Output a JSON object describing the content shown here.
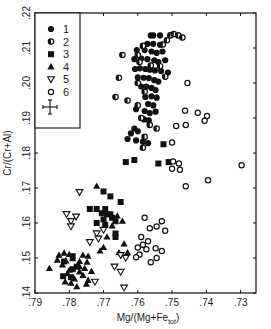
{
  "chart_data": {
    "type": "scatter",
    "title": "",
    "xlabel": "Mg/(Mg+Fe_tot)",
    "xlabel_main": "Mg/(Mg+Fe",
    "xlabel_sub": "tot",
    "xlabel_close": ")",
    "ylabel": "Cr/(Cr+Al)",
    "xlim": [
      0.79,
      0.7255
    ],
    "ylim": [
      0.14,
      0.22
    ],
    "x_reversed": true,
    "grid": false,
    "legend_position": "upper-left (inside frame)",
    "x_ticks": [
      0.79,
      0.78,
      0.77,
      0.76,
      0.75,
      0.74,
      0.73
    ],
    "x_tick_labels": [
      ".79",
      ".78",
      ".77",
      ".76",
      ".75",
      ".74",
      ".73"
    ],
    "y_ticks": [
      0.14,
      0.15,
      0.16,
      0.17,
      0.18,
      0.19,
      0.2,
      0.21,
      0.22
    ],
    "y_tick_labels": [
      ".14",
      ".15",
      ".16",
      ".17",
      ".18",
      ".19",
      ".20",
      ".21",
      ".22"
    ],
    "error_bar_legend": {
      "x_err": 0.0015,
      "y_err": 0.0015
    },
    "series": [
      {
        "name": "1",
        "marker": "filled-circle",
        "points": [
          [
            0.7562,
            0.2136
          ],
          [
            0.7555,
            0.2136
          ],
          [
            0.7535,
            0.2136
          ],
          [
            0.7572,
            0.2112
          ],
          [
            0.7555,
            0.2112
          ],
          [
            0.7535,
            0.2109
          ],
          [
            0.7603,
            0.2094
          ],
          [
            0.758,
            0.2094
          ],
          [
            0.756,
            0.209
          ],
          [
            0.7545,
            0.2086
          ],
          [
            0.7528,
            0.209
          ],
          [
            0.761,
            0.2068
          ],
          [
            0.759,
            0.207
          ],
          [
            0.7572,
            0.2068
          ],
          [
            0.7552,
            0.2065
          ],
          [
            0.754,
            0.206
          ],
          [
            0.752,
            0.2065
          ],
          [
            0.7608,
            0.204
          ],
          [
            0.7594,
            0.2042
          ],
          [
            0.7578,
            0.204
          ],
          [
            0.7565,
            0.2038
          ],
          [
            0.755,
            0.2036
          ],
          [
            0.7532,
            0.2034
          ],
          [
            0.7512,
            0.203
          ],
          [
            0.76,
            0.2016
          ],
          [
            0.7583,
            0.2015
          ],
          [
            0.7568,
            0.2014
          ],
          [
            0.7552,
            0.2008
          ],
          [
            0.754,
            0.2004
          ],
          [
            0.759,
            0.199
          ],
          [
            0.7575,
            0.199
          ],
          [
            0.756,
            0.1986
          ],
          [
            0.7548,
            0.198
          ],
          [
            0.7578,
            0.196
          ],
          [
            0.756,
            0.1962
          ],
          [
            0.7545,
            0.1958
          ],
          [
            0.757,
            0.194
          ],
          [
            0.7555,
            0.1936
          ],
          [
            0.7605,
            0.1925
          ],
          [
            0.758,
            0.192
          ],
          [
            0.7565,
            0.1914
          ],
          [
            0.7548,
            0.1918
          ],
          [
            0.7582,
            0.1896
          ],
          [
            0.7568,
            0.1893
          ],
          [
            0.761,
            0.187
          ],
          [
            0.76,
            0.1862
          ],
          [
            0.762,
            0.1856
          ],
          [
            0.763,
            0.184
          ],
          [
            0.7605,
            0.1836
          ],
          [
            0.7585,
            0.1832
          ],
          [
            0.757,
            0.1828
          ]
        ]
      },
      {
        "name": "2",
        "marker": "half-filled-circle",
        "points": [
          [
            0.7505,
            0.2136
          ],
          [
            0.7495,
            0.214
          ],
          [
            0.7482,
            0.2136
          ],
          [
            0.747,
            0.213
          ],
          [
            0.7515,
            0.2122
          ],
          [
            0.7527,
            0.211
          ],
          [
            0.7585,
            0.2106
          ],
          [
            0.76,
            0.208
          ],
          [
            0.7595,
            0.206
          ],
          [
            0.7562,
            0.205
          ],
          [
            0.7535,
            0.2048
          ],
          [
            0.752,
            0.2018
          ],
          [
            0.7645,
            0.208
          ],
          [
            0.7655,
            0.2015
          ],
          [
            0.76,
            0.2
          ],
          [
            0.758,
            0.1975
          ],
          [
            0.7665,
            0.196
          ],
          [
            0.763,
            0.195
          ],
          [
            0.76,
            0.1936
          ],
          [
            0.759,
            0.19
          ],
          [
            0.7565,
            0.188
          ],
          [
            0.7545,
            0.187
          ],
          [
            0.758,
            0.1846
          ],
          [
            0.7585,
            0.1815
          ]
        ]
      },
      {
        "name": "3",
        "marker": "filled-square",
        "points": [
          [
            0.7525,
            0.1825
          ],
          [
            0.761,
            0.178
          ],
          [
            0.7635,
            0.1774
          ],
          [
            0.751,
            0.1774
          ],
          [
            0.754,
            0.177
          ],
          [
            0.77,
            0.169
          ],
          [
            0.768,
            0.1676
          ],
          [
            0.765,
            0.166
          ],
          [
            0.772,
            0.164
          ],
          [
            0.7695,
            0.164
          ],
          [
            0.768,
            0.1625
          ],
          [
            0.774,
            0.164
          ],
          [
            0.7705,
            0.1628
          ],
          [
            0.769,
            0.1625
          ],
          [
            0.7675,
            0.1615
          ],
          [
            0.77,
            0.161
          ],
          [
            0.7665,
            0.1605
          ],
          [
            0.7695,
            0.1595
          ],
          [
            0.772,
            0.16
          ],
          [
            0.7665,
            0.157
          ],
          [
            0.7665,
            0.156
          ],
          [
            0.779,
            0.1505
          ],
          [
            0.7815,
            0.149
          ],
          [
            0.779,
            0.1468
          ],
          [
            0.7795,
            0.1445
          ],
          [
            0.7818,
            0.1448
          ],
          [
            0.7778,
            0.1475
          ]
        ]
      },
      {
        "name": "4",
        "marker": "filled-triangle-up",
        "points": [
          [
            0.772,
            0.1705
          ],
          [
            0.766,
            0.162
          ],
          [
            0.7645,
            0.1605
          ],
          [
            0.7675,
            0.1592
          ],
          [
            0.769,
            0.156
          ],
          [
            0.77,
            0.153
          ],
          [
            0.771,
            0.152
          ],
          [
            0.764,
            0.154
          ],
          [
            0.763,
            0.1515
          ],
          [
            0.7655,
            0.1515
          ],
          [
            0.7815,
            0.1514
          ],
          [
            0.78,
            0.151
          ],
          [
            0.783,
            0.1508
          ],
          [
            0.779,
            0.1498
          ],
          [
            0.776,
            0.1508
          ],
          [
            0.7745,
            0.1505
          ],
          [
            0.7835,
            0.1494
          ],
          [
            0.781,
            0.1492
          ],
          [
            0.777,
            0.149
          ],
          [
            0.7748,
            0.1488
          ],
          [
            0.782,
            0.148
          ],
          [
            0.777,
            0.1475
          ],
          [
            0.7755,
            0.147
          ],
          [
            0.7858,
            0.147
          ],
          [
            0.78,
            0.1465
          ],
          [
            0.777,
            0.146
          ],
          [
            0.7735,
            0.1462
          ],
          [
            0.7805,
            0.1455
          ],
          [
            0.776,
            0.145
          ],
          [
            0.7785,
            0.144
          ],
          [
            0.7812,
            0.1432
          ],
          [
            0.7795,
            0.1428
          ],
          [
            0.7745,
            0.1436
          ],
          [
            0.775,
            0.1425
          ],
          [
            0.7778,
            0.1418
          ]
        ]
      },
      {
        "name": "5",
        "marker": "open-triangle-down",
        "points": [
          [
            0.777,
            0.1688
          ],
          [
            0.7808,
            0.1625
          ],
          [
            0.778,
            0.1618
          ],
          [
            0.7795,
            0.1605
          ],
          [
            0.7795,
            0.159
          ],
          [
            0.77,
            0.158
          ],
          [
            0.772,
            0.157
          ],
          [
            0.7715,
            0.1555
          ],
          [
            0.774,
            0.1545
          ],
          [
            0.765,
            0.1508
          ],
          [
            0.7635,
            0.15
          ],
          [
            0.7668,
            0.1475
          ],
          [
            0.765,
            0.146
          ],
          [
            0.7725,
            0.1432
          ],
          [
            0.764,
            0.1415
          ]
        ]
      },
      {
        "name": "6",
        "marker": "open-circle",
        "points": [
          [
            0.7455,
            0.2
          ],
          [
            0.7462,
            0.1921
          ],
          [
            0.7425,
            0.1915
          ],
          [
            0.7398,
            0.1906
          ],
          [
            0.7405,
            0.1892
          ],
          [
            0.7488,
            0.1877
          ],
          [
            0.746,
            0.188
          ],
          [
            0.75,
            0.183
          ],
          [
            0.7497,
            0.1776
          ],
          [
            0.748,
            0.177
          ],
          [
            0.75,
            0.1755
          ],
          [
            0.7477,
            0.1752
          ],
          [
            0.7297,
            0.1765
          ],
          [
            0.7395,
            0.1722
          ],
          [
            0.746,
            0.1705
          ],
          [
            0.753,
            0.1605
          ],
          [
            0.758,
            0.1615
          ],
          [
            0.7565,
            0.1585
          ],
          [
            0.7545,
            0.159
          ],
          [
            0.752,
            0.1578
          ],
          [
            0.759,
            0.156
          ],
          [
            0.757,
            0.1548
          ],
          [
            0.7585,
            0.1538
          ],
          [
            0.76,
            0.153
          ],
          [
            0.7575,
            0.1525
          ],
          [
            0.7548,
            0.1528
          ],
          [
            0.753,
            0.152
          ],
          [
            0.7595,
            0.151
          ],
          [
            0.7605,
            0.1502
          ],
          [
            0.7562,
            0.1488
          ],
          [
            0.7545,
            0.15
          ]
        ]
      }
    ]
  },
  "legend": {
    "items": [
      {
        "label": "1",
        "marker": "filled-circle"
      },
      {
        "label": "2",
        "marker": "half-filled-circle"
      },
      {
        "label": "3",
        "marker": "filled-square"
      },
      {
        "label": "4",
        "marker": "filled-triangle-up"
      },
      {
        "label": "5",
        "marker": "open-triangle-down"
      },
      {
        "label": "6",
        "marker": "open-circle"
      }
    ],
    "error_bar_icon": "error-cross-icon"
  },
  "colors": {
    "ink": "#111111",
    "frame": "#222222",
    "background": "#ffffff"
  }
}
